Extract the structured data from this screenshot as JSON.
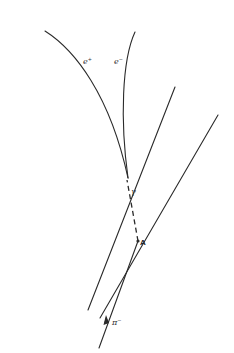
{
  "diagram": {
    "type": "bubble-chamber-track-diagram",
    "background": "#ffffff",
    "stroke_color": "#2a2a2a",
    "tracks": [
      {
        "id": "e-plus",
        "kind": "curve",
        "label": "e",
        "label_sup": "+",
        "from": [
          45,
          31
        ],
        "to": [
          128,
          178
        ]
      },
      {
        "id": "e-minus",
        "kind": "curve",
        "label": "e",
        "label_sup": "−",
        "from": [
          135,
          32
        ],
        "to": [
          128,
          178
        ]
      },
      {
        "id": "track-1",
        "kind": "line",
        "from": [
          175,
          87
        ],
        "to": [
          88,
          310
        ]
      },
      {
        "id": "track-2",
        "kind": "line",
        "from": [
          218,
          115
        ],
        "to": [
          100,
          318
        ]
      },
      {
        "id": "pi-minus",
        "kind": "line",
        "label": "π",
        "label_sup": "−",
        "from": [
          99,
          348
        ],
        "to": [
          138,
          241
        ]
      },
      {
        "id": "gamma",
        "kind": "dashed",
        "label": "γ",
        "from": [
          138,
          241
        ],
        "to": [
          128,
          190
        ]
      }
    ],
    "labels": {
      "e_plus": "e",
      "e_plus_sup": "+",
      "e_minus": "e",
      "e_minus_sup": "−",
      "gamma": "γ",
      "vertex_A": "A",
      "pi_minus": "π",
      "pi_minus_sup": "−"
    }
  }
}
